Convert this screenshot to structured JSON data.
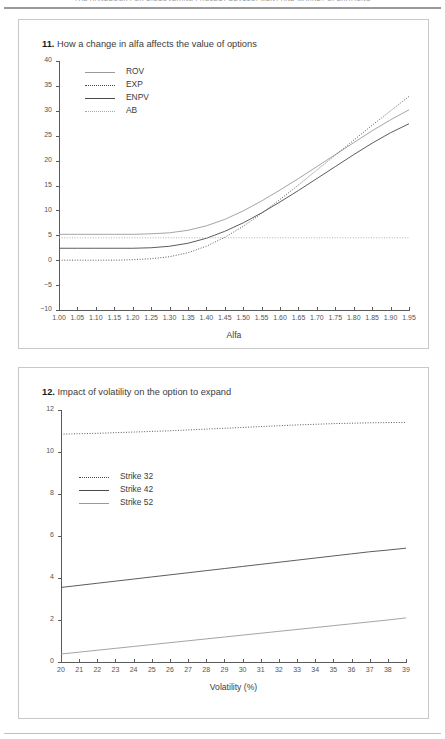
{
  "page": {
    "running_head": "THE HANDBOOK FOR DISCOVERING PROJECT DEVELOPMENT AND MARKET OPERATIONS",
    "width": 445,
    "height": 739
  },
  "figures": [
    {
      "number": "11.",
      "title": "How a change in alfa affects the value of options",
      "caption": "11. How a change in alfa affects the value of options"
    },
    {
      "number": "12.",
      "title": "Impact of volatility on the option to expand",
      "caption": "12. Impact of volatility on the option to expand"
    }
  ],
  "chart_data": [
    {
      "type": "line",
      "title": "How a change in alfa affects the value of options",
      "xlabel": "Alfa",
      "ylabel": "",
      "xlim": [
        1.0,
        1.95
      ],
      "ylim": [
        -10,
        40
      ],
      "grid": false,
      "legend_position": "top-left",
      "xticklabels": [
        "1.00",
        "1.05",
        "1.10",
        "1.15",
        "1.20",
        "1.25",
        "1.30",
        "1.35",
        "1.40",
        "1.45",
        "1.50",
        "1.55",
        "1.60",
        "1.65",
        "1.70",
        "1.75",
        "1.80",
        "1.85",
        "1.90",
        "1.95"
      ],
      "yticklabels": [
        "40",
        "35",
        "30",
        "25",
        "20",
        "15",
        "10",
        "5",
        "0",
        "-5",
        "-10"
      ],
      "x": [
        1.0,
        1.05,
        1.1,
        1.15,
        1.2,
        1.25,
        1.3,
        1.35,
        1.4,
        1.45,
        1.5,
        1.55,
        1.6,
        1.65,
        1.7,
        1.75,
        1.8,
        1.85,
        1.9,
        1.95
      ],
      "series": [
        {
          "name": "ROV",
          "style": "solid-gray",
          "values": [
            5.2,
            5.2,
            5.2,
            5.2,
            5.2,
            5.3,
            5.5,
            6.0,
            6.9,
            8.2,
            9.9,
            11.9,
            14.1,
            16.4,
            18.8,
            21.2,
            23.6,
            26.0,
            28.2,
            30.2
          ]
        },
        {
          "name": "EXP",
          "style": "dotted-dark",
          "values": [
            0.0,
            0.0,
            0.0,
            0.0,
            0.1,
            0.3,
            0.7,
            1.5,
            2.8,
            4.6,
            6.8,
            9.4,
            12.2,
            15.1,
            18.1,
            21.1,
            24.1,
            27.1,
            30.0,
            32.9
          ]
        },
        {
          "name": "ENPV",
          "style": "solid-dark",
          "values": [
            2.4,
            2.4,
            2.4,
            2.4,
            2.4,
            2.5,
            2.8,
            3.4,
            4.4,
            5.8,
            7.5,
            9.5,
            11.7,
            14.0,
            16.4,
            18.8,
            21.2,
            23.5,
            25.6,
            27.4
          ]
        },
        {
          "name": "AB",
          "style": "dotted-gray",
          "values": [
            4.5,
            4.5,
            4.5,
            4.5,
            4.5,
            4.5,
            4.5,
            4.5,
            4.5,
            4.5,
            4.5,
            4.5,
            4.5,
            4.5,
            4.5,
            4.5,
            4.5,
            4.5,
            4.5,
            4.5
          ]
        }
      ]
    },
    {
      "type": "line",
      "title": "Impact of volatility on the option to expand",
      "xlabel": "Volatility (%)",
      "ylabel": "",
      "xlim": [
        20,
        39
      ],
      "ylim": [
        0,
        12
      ],
      "grid": false,
      "legend_position": "middle-left",
      "xticklabels": [
        "20",
        "21",
        "22",
        "23",
        "24",
        "25",
        "26",
        "27",
        "28",
        "29",
        "30",
        "31",
        "32",
        "33",
        "34",
        "35",
        "36",
        "37",
        "38",
        "39"
      ],
      "yticklabels": [
        "12",
        "10",
        "8",
        "6",
        "4",
        "2",
        "0"
      ],
      "x": [
        20,
        21,
        22,
        23,
        24,
        25,
        26,
        27,
        28,
        29,
        30,
        31,
        32,
        33,
        34,
        35,
        36,
        37,
        38,
        39
      ],
      "series": [
        {
          "name": "Strike 32",
          "style": "dotted-dark",
          "values": [
            10.85,
            10.87,
            10.89,
            10.92,
            10.95,
            10.98,
            11.01,
            11.05,
            11.09,
            11.13,
            11.17,
            11.21,
            11.25,
            11.29,
            11.32,
            11.35,
            11.37,
            11.39,
            11.4,
            11.41
          ]
        },
        {
          "name": "Strike 42",
          "style": "solid-dark",
          "values": [
            3.55,
            3.65,
            3.75,
            3.85,
            3.95,
            4.05,
            4.15,
            4.25,
            4.35,
            4.45,
            4.55,
            4.65,
            4.75,
            4.85,
            4.95,
            5.05,
            5.15,
            5.25,
            5.33,
            5.42
          ]
        },
        {
          "name": "Strike 52",
          "style": "solid-gray",
          "values": [
            0.38,
            0.47,
            0.56,
            0.65,
            0.74,
            0.83,
            0.92,
            1.01,
            1.1,
            1.19,
            1.28,
            1.37,
            1.46,
            1.55,
            1.64,
            1.73,
            1.82,
            1.91,
            2.0,
            2.1
          ]
        }
      ]
    }
  ],
  "colors": {
    "solid_dark": "#4a4a4a",
    "solid_gray": "#9a9a9a",
    "dotted_dark": "#4a4a4a",
    "dotted_gray": "#a8a8a8",
    "axis": "#5a5a5a",
    "border": "#c8c8c8",
    "text": "#3b3b3b"
  }
}
